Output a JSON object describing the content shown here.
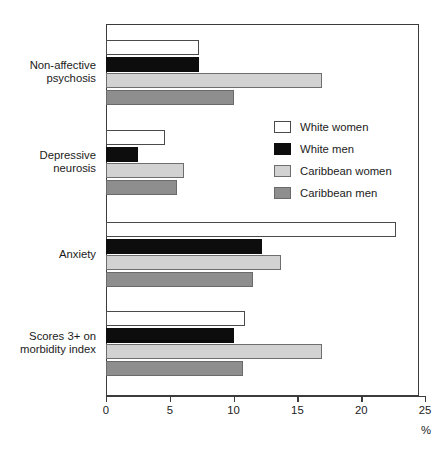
{
  "chart_data": {
    "type": "bar",
    "orientation": "horizontal",
    "title": "",
    "xlabel": "%",
    "ylabel": "",
    "xlim": [
      0,
      25
    ],
    "xticks": [
      0,
      5,
      10,
      15,
      20,
      25
    ],
    "xtick_labels": [
      "0",
      "5",
      "10",
      "15",
      "20",
      "25"
    ],
    "grid": false,
    "legend_position": "inside-upper-right",
    "categories": [
      "Non-affective\npsychosis",
      "Depressive\nneurosis",
      "Anxiety",
      "Scores 3+ on\nmorbidity index"
    ],
    "series": [
      {
        "name": "White women",
        "color": "#ffffff",
        "values": [
          7.3,
          4.6,
          22.7,
          10.9
        ]
      },
      {
        "name": "White men",
        "color": "#0d0d0d",
        "values": [
          7.3,
          2.5,
          12.2,
          10.0
        ]
      },
      {
        "name": "Caribbean women",
        "color": "#d2d2d2",
        "values": [
          16.9,
          6.1,
          13.7,
          16.9
        ]
      },
      {
        "name": "Caribbean men",
        "color": "#8e8e8e",
        "values": [
          10.0,
          5.6,
          11.5,
          10.7
        ]
      }
    ]
  }
}
